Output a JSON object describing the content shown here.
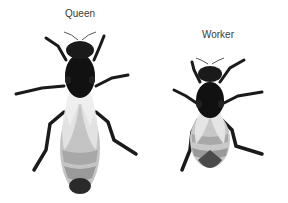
{
  "labels": {
    "queen": "Queen",
    "worker": "Worker"
  },
  "colors": {
    "body_dark": "#1a1a1a",
    "wing_light": "#e4e4e4",
    "abdomen_mid": "#b8b8b8",
    "abdomen_dark": "#8e8e8e",
    "label": "#3a3a3a"
  }
}
